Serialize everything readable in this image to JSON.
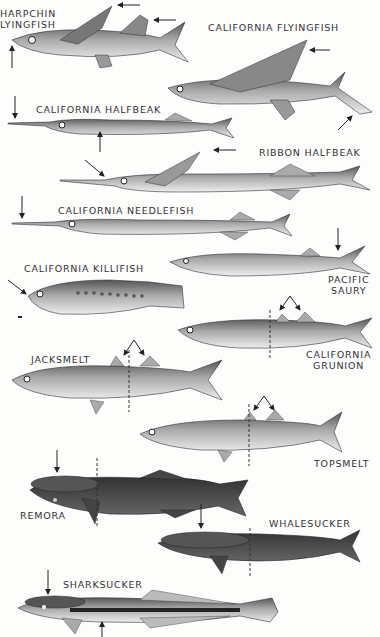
{
  "plate": {
    "title": "Flyingfishes, halfbeaks, needlefish, saury, killifish, silversides, remoras",
    "background": "#fdfdfc",
    "ink": "#333333"
  },
  "species": [
    {
      "id": "sharpchin-flyingfish",
      "label_line1": "HARPCHIN",
      "label_line2": "LYINGFISH"
    },
    {
      "id": "california-flyingfish",
      "label": "CALIFORNIA FLYINGFISH"
    },
    {
      "id": "california-halfbeak",
      "label": "CALIFORNIA HALFBEAK"
    },
    {
      "id": "ribbon-halfbeak",
      "label": "RIBBON HALFBEAK"
    },
    {
      "id": "california-needlefish",
      "label": "CALIFORNIA NEEDLEFISH"
    },
    {
      "id": "california-killifish",
      "label": "CALIFORNIA KILLIFISH"
    },
    {
      "id": "pacific-saury",
      "label_line1": "PACIFIC",
      "label_line2": "SAURY"
    },
    {
      "id": "california-grunion",
      "label_line1": "CALIFORNIA",
      "label_line2": "GRUNION"
    },
    {
      "id": "jacksmelt",
      "label": "JACKSMELT"
    },
    {
      "id": "topsmelt",
      "label": "TOPSMELT"
    },
    {
      "id": "remora",
      "label": "REMORA"
    },
    {
      "id": "whalesucker",
      "label": "WHALESUCKER"
    },
    {
      "id": "sharksucker",
      "label": "SHARKSUCKER"
    }
  ]
}
